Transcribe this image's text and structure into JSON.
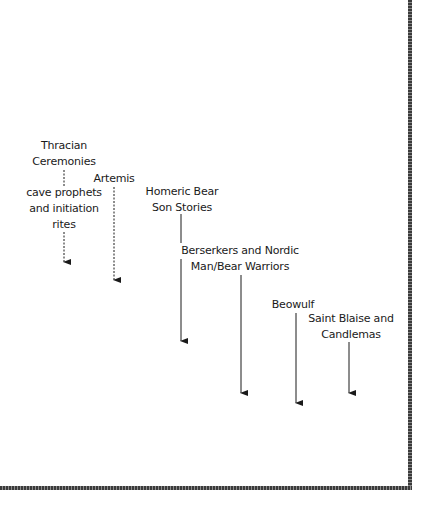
{
  "diagram": {
    "nodes": [
      {
        "id": "thracian",
        "lines": [
          "Thracian",
          "Ceremonies"
        ]
      },
      {
        "id": "cave",
        "lines": [
          "cave prophets",
          "and initiation",
          "rites"
        ]
      },
      {
        "id": "artemis",
        "lines": [
          "Artemis"
        ]
      },
      {
        "id": "homeric",
        "lines": [
          "Homeric Bear",
          "Son Stories"
        ]
      },
      {
        "id": "berserkers",
        "lines": [
          "Berserkers and Nordic",
          "Man/Bear Warriors"
        ]
      },
      {
        "id": "beowulf",
        "lines": [
          "Beowulf"
        ]
      },
      {
        "id": "blaise",
        "lines": [
          "Saint Blaise and",
          "Candlemas"
        ]
      }
    ],
    "connectors": [
      {
        "from": "thracian",
        "to": "cave",
        "style": "dashed"
      },
      {
        "from": "cave",
        "style": "dashed-arrow"
      },
      {
        "from": "artemis",
        "style": "dashed-arrow"
      },
      {
        "from": "homeric",
        "to": "berserkers",
        "style": "solid"
      },
      {
        "from": "homeric",
        "style": "solid-arrow"
      },
      {
        "from": "berserkers",
        "style": "solid-arrow"
      },
      {
        "from": "beowulf",
        "style": "solid-arrow"
      },
      {
        "from": "blaise",
        "style": "solid-arrow"
      }
    ],
    "colors": {
      "text": "#1a1a1a",
      "border": "#3a3a3a",
      "background": "#ffffff"
    }
  }
}
